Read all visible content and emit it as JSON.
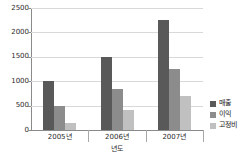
{
  "chart_data": {
    "type": "bar",
    "title": "",
    "xlabel": "년도",
    "ylabel": "",
    "categories": [
      "2005년",
      "2006년",
      "2007년"
    ],
    "series": [
      {
        "name": "매출",
        "color": "#595959",
        "values": [
          1000,
          1500,
          2250
        ]
      },
      {
        "name": "이익",
        "color": "#8c8c8c",
        "values": [
          500,
          850,
          1250
        ]
      },
      {
        "name": "고정비",
        "color": "#c0c0c0",
        "values": [
          150,
          400,
          700
        ]
      }
    ],
    "ylim": [
      0,
      2500
    ],
    "yticks": [
      0,
      500,
      1000,
      1500,
      2000,
      2500
    ],
    "ytick_labels": [
      "0",
      "500",
      "1000",
      "1500",
      "2000",
      "2500"
    ],
    "grid": true,
    "legend_position": "right"
  }
}
